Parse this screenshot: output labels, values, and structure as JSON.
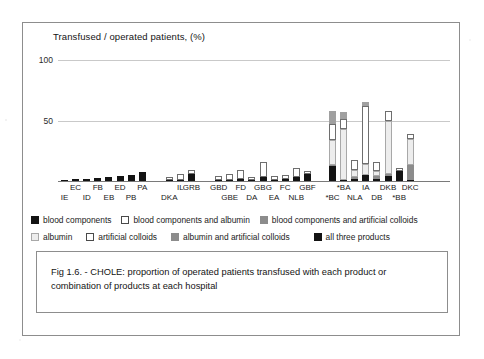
{
  "figure": {
    "caption": "Fig 1.6. - CHOLE: proportion of operated patients  transfused with each product or combination of  products at each hospital"
  },
  "chart_data": {
    "type": "bar",
    "stacked": true,
    "title": "Transfused / operated patients,  (%)",
    "xlabel": "",
    "ylabel": "Transfused / operated patients,  (%)",
    "ylim": [
      0,
      100
    ],
    "yticks": [
      50,
      100
    ],
    "ytick_labels": [
      "50",
      "100"
    ],
    "grid": true,
    "legend_position": "below",
    "categories": [
      "IE",
      "EC",
      "ID",
      "FB",
      "EB",
      "ED",
      "PB",
      "PA",
      "DKA",
      "IL",
      "GRB",
      "GBD",
      "GBE",
      "FD",
      "DA",
      "GBG",
      "EA",
      "FC",
      "NLB",
      "GBF",
      "*BC",
      "*BA",
      "NLA",
      "IA",
      "DB",
      "DKB",
      "*BB",
      "DKC"
    ],
    "category_rows": {
      "row1": [
        "EC",
        "FB",
        "ED",
        "PA",
        "IL",
        "GRB",
        "GBD",
        "FD",
        "GBG",
        "FC",
        "GBF",
        "*BA",
        "IA",
        "DKB",
        "DKC"
      ],
      "row2": [
        "IE",
        "ID",
        "EB",
        "PB",
        "DKA",
        "GBE",
        "DA",
        "EA",
        "NLB",
        "*BC",
        "NLA",
        "DB",
        "*BB"
      ]
    },
    "series": [
      {
        "name": "blood components",
        "color": "#131313",
        "values": [
          0.6,
          1.4,
          1.8,
          2.6,
          3.4,
          4.2,
          5.2,
          7.2,
          0.8,
          1.2,
          5.4,
          0.4,
          0.3,
          2.0,
          0.4,
          3.0,
          0.6,
          1.6,
          3.2,
          6.0,
          12.0,
          1.0,
          2.0,
          5.0,
          1.5,
          4.0,
          8.0,
          1.0
        ]
      },
      {
        "name": "blood components and albumin",
        "color": "#ffffff",
        "values": [
          0,
          0,
          0,
          0,
          0,
          0,
          0,
          0,
          0,
          0,
          0,
          0,
          0,
          0,
          0,
          0,
          0,
          0,
          0,
          0,
          0,
          0,
          0,
          0,
          0,
          0,
          0,
          0
        ]
      },
      {
        "name": "blood components and artificial colloids",
        "color": "#8c8c8c",
        "values": [
          0,
          0,
          0,
          0,
          0,
          0,
          0,
          0,
          0,
          0,
          0,
          0,
          0,
          0,
          0,
          0,
          0,
          0,
          0,
          0,
          1.5,
          0,
          1.5,
          0,
          2.5,
          2.0,
          0,
          12.0
        ]
      },
      {
        "name": "albumin",
        "color": "#ededed",
        "values": [
          0,
          0,
          0,
          0,
          0,
          0,
          0,
          0,
          0,
          0,
          0,
          0,
          0,
          0,
          0,
          0,
          0,
          0,
          0,
          0,
          20.0,
          42.0,
          6.0,
          9.0,
          4.0,
          44.0,
          0,
          22.0
        ]
      },
      {
        "name": "artificial colloids",
        "color": "#ffffff",
        "values": [
          0,
          0,
          0,
          0,
          0,
          0,
          0,
          0,
          2.5,
          4.5,
          4.0,
          3.5,
          5.0,
          7.0,
          2.5,
          13.0,
          3.5,
          3.0,
          7.5,
          2.0,
          14.0,
          8.0,
          8.0,
          48.0,
          7.5,
          8.0,
          3.0,
          4.0
        ]
      },
      {
        "name": "albumin and artificial colloids",
        "color": "#a0a0a0",
        "values": [
          0,
          0,
          0,
          0,
          0,
          0,
          0,
          0,
          0,
          0,
          0,
          0,
          0,
          0,
          0,
          0,
          0,
          0,
          0,
          0,
          10.0,
          6.0,
          0,
          3.0,
          0,
          0,
          0,
          0
        ]
      },
      {
        "name": "all three products",
        "color": "#0d0d0d",
        "values": [
          0,
          0,
          0,
          0,
          0,
          0,
          0,
          0,
          0,
          0,
          0,
          0,
          0,
          0,
          0,
          0,
          0,
          0,
          0,
          0,
          0,
          0,
          0,
          0,
          0,
          0,
          0,
          0
        ]
      }
    ]
  },
  "legend": {
    "rows": [
      [
        {
          "label": "blood components",
          "swatch": "solid-black"
        },
        {
          "label": "blood components and albumin",
          "swatch": "outline-white"
        },
        {
          "label": "blood components and artificial colloids",
          "swatch": "solid-gray"
        }
      ],
      [
        {
          "label": "albumin",
          "swatch": "light-gray"
        },
        {
          "label": "artificial colloids",
          "swatch": "outline-white"
        },
        {
          "label": "albumin and artificial colloids",
          "swatch": "solid-gray"
        },
        {
          "label": "all three products",
          "swatch": "solid-black"
        }
      ]
    ]
  }
}
